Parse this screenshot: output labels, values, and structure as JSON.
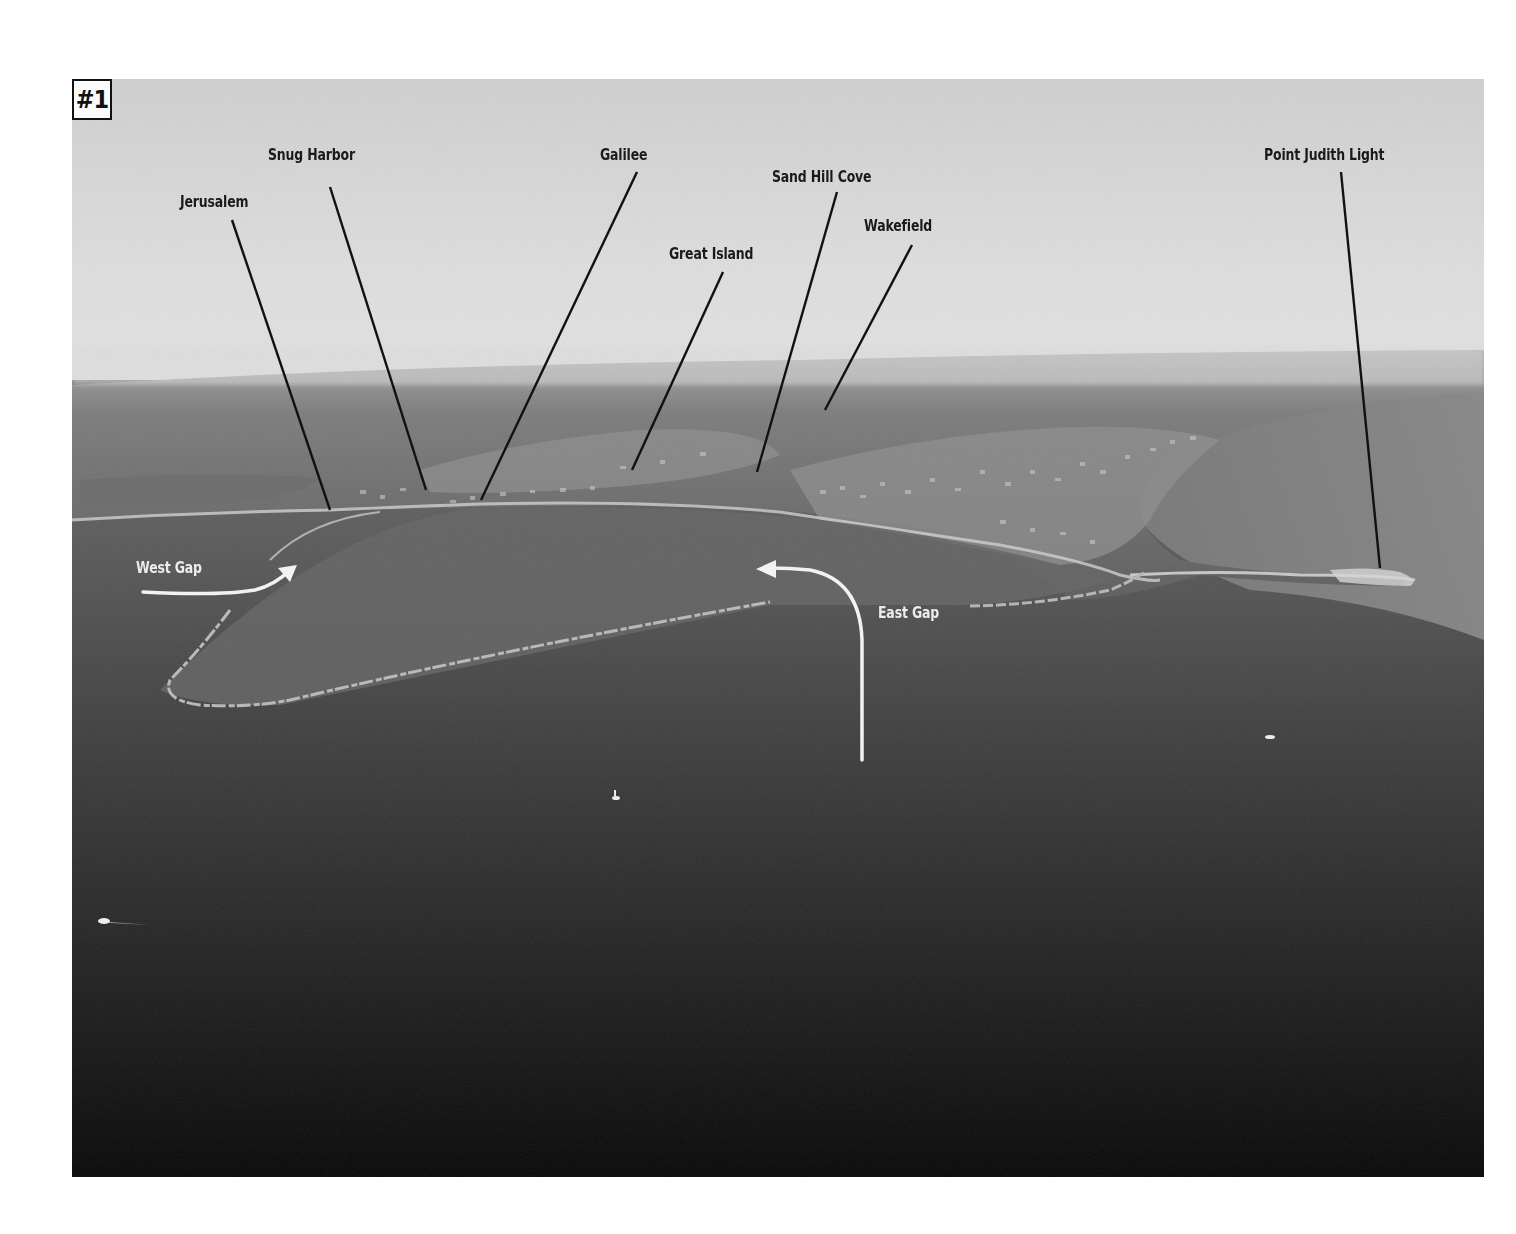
{
  "figure": {
    "badge": "#1"
  },
  "place_labels": [
    {
      "id": "jerusalem",
      "text": "Jerusalem",
      "x": 180,
      "y": 192,
      "line": [
        232,
        220,
        330,
        510
      ]
    },
    {
      "id": "snug-harbor",
      "text": "Snug Harbor",
      "x": 268,
      "y": 145,
      "line": [
        330,
        187,
        426,
        490
      ]
    },
    {
      "id": "galilee",
      "text": "Galilee",
      "x": 600,
      "y": 145,
      "line": [
        637,
        172,
        481,
        500
      ]
    },
    {
      "id": "great-island",
      "text": "Great Island",
      "x": 669,
      "y": 244,
      "line": [
        723,
        272,
        632,
        470
      ]
    },
    {
      "id": "sand-hill-cove",
      "text": "Sand Hill Cove",
      "x": 772,
      "y": 167,
      "line": [
        837,
        192,
        757,
        472
      ]
    },
    {
      "id": "wakefield",
      "text": "Wakefield",
      "x": 864,
      "y": 216,
      "line": [
        912,
        245,
        825,
        410
      ]
    },
    {
      "id": "point-judith-light",
      "text": "Point Judith Light",
      "x": 1264,
      "y": 145,
      "line": [
        1341,
        172,
        1380,
        568
      ]
    }
  ],
  "route_labels": [
    {
      "id": "west-gap",
      "text": "West Gap",
      "x": 136,
      "y": 558
    },
    {
      "id": "east-gap",
      "text": "East Gap",
      "x": 878,
      "y": 603
    }
  ],
  "colors": {
    "sky_top": "#d6d6d6",
    "sky_horizon": "#e4e4e4",
    "land": "#6e6e6e",
    "water_near_shore": "#6a6a6a",
    "water_far": "#101010",
    "leader_line": "#111111",
    "arrow": "#f2f2f2"
  }
}
